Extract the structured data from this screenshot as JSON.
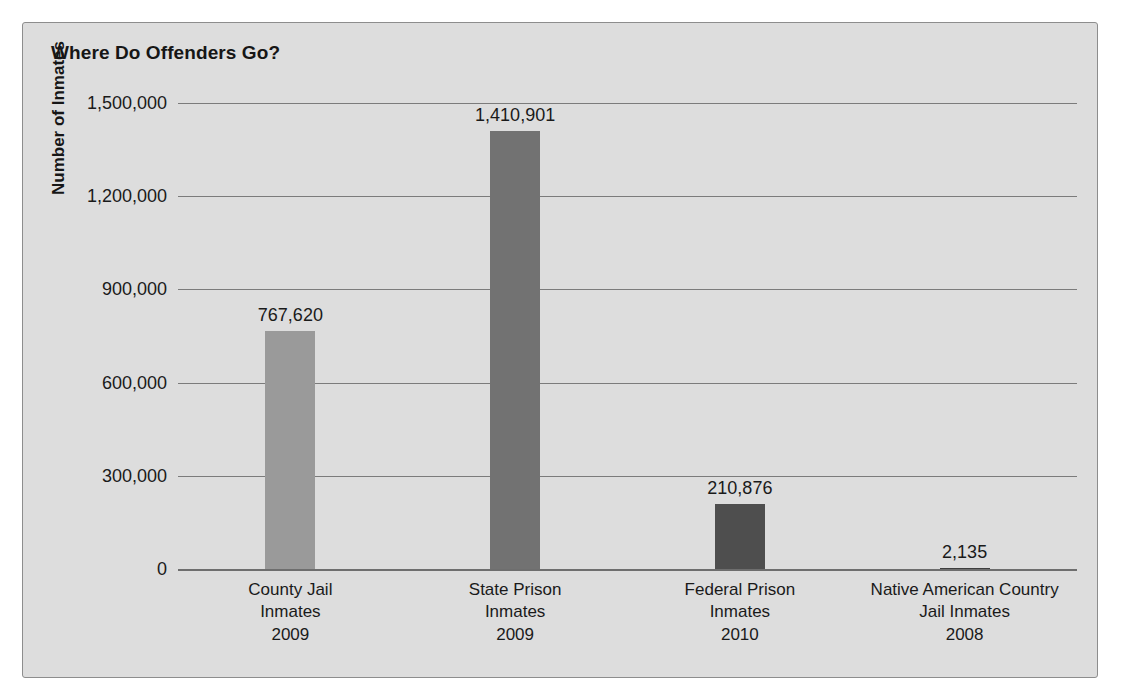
{
  "chart_data": {
    "type": "bar",
    "title": "Where Do Offenders Go?",
    "xlabel": "",
    "ylabel": "Number of Inmates",
    "ylim": [
      0,
      1500000
    ],
    "grid": true,
    "legend": "none",
    "categories": [
      "County Jail Inmates 2009",
      "State Prison Inmates 2009",
      "Federal Prison Inmates 2010",
      "Native American Country Jail Inmates 2008"
    ],
    "values": [
      767620,
      1410901,
      210876,
      2135
    ],
    "value_labels": [
      "767,620",
      "1,410,901",
      "210,876",
      "2,135"
    ],
    "ytick_values": [
      0,
      300000,
      600000,
      900000,
      1200000,
      1500000
    ],
    "ytick_labels": [
      "0",
      "300,000",
      "600,000",
      "900,000",
      "1,200,000",
      "1,500,000"
    ],
    "bars": [
      {
        "name": "county-jail-inmates",
        "line1": "County Jail",
        "line2": "Inmates",
        "line3": "2009",
        "value": 767620,
        "label": "767,620",
        "color": "#9a9a9a"
      },
      {
        "name": "state-prison-inmates",
        "line1": "State Prison",
        "line2": "Inmates",
        "line3": "2009",
        "value": 1410901,
        "label": "1,410,901",
        "color": "#727272"
      },
      {
        "name": "federal-prison-inmates",
        "line1": "Federal Prison",
        "line2": "Inmates",
        "line3": "2010",
        "value": 210876,
        "label": "210,876",
        "color": "#4e4e4e"
      },
      {
        "name": "native-american-country-jail-inmates",
        "line1": "Native American Country",
        "line2": "Jail Inmates",
        "line3": "2008",
        "value": 2135,
        "label": "2,135",
        "color": "#3f3f3f"
      }
    ],
    "colors": {
      "figure_background": "#dddddd",
      "page_background": "#ffffff",
      "border": "#8d8d8d",
      "gridline": "#7b7b7b",
      "text": "#1a1a1a"
    }
  }
}
